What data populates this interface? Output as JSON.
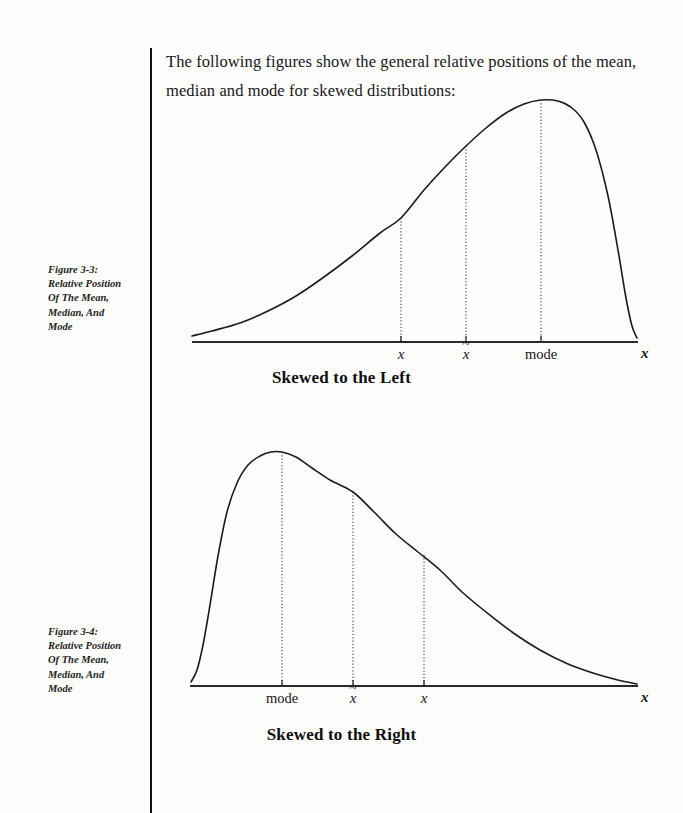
{
  "document": {
    "intro_text": "The following figures show the general relative positions of the mean, median and mode for skewed distributions:"
  },
  "captions": {
    "figure1": {
      "line1": "Figure 3-3:",
      "line2": "Relative Position",
      "line3": "Of The Mean,",
      "line4": "Median, And",
      "line5": "Mode"
    },
    "figure2": {
      "line1": "Figure 3-4:",
      "line2": "Relative Position",
      "line3": "Of The Mean,",
      "line4": "Median, And",
      "line5": "Mode"
    }
  },
  "symbols": {
    "mean_base": "x",
    "mean_mark": "‾",
    "median_base": "x",
    "median_mark": "~",
    "mode_label": "mode",
    "axis_variable": "x"
  },
  "chart_data": [
    {
      "type": "line",
      "title": "Skewed to the Left",
      "xlabel": "x",
      "ylabel": "",
      "grid": false,
      "legend": false,
      "annotations": [
        {
          "name": "mean",
          "label": "x̄",
          "x": 401,
          "curve_y": 218
        },
        {
          "name": "median",
          "label": "x̃",
          "x": 466,
          "curve_y": 146
        },
        {
          "name": "mode",
          "label": "mode",
          "x": 541,
          "curve_y": 100
        }
      ],
      "axis": {
        "x_start": 192,
        "x_end": 638,
        "y": 342
      },
      "peak": {
        "x": 541,
        "y": 100
      },
      "tail_side": "left",
      "curve_points": [
        [
          192,
          336
        ],
        [
          212,
          331
        ],
        [
          240,
          323
        ],
        [
          268,
          311
        ],
        [
          296,
          296
        ],
        [
          324,
          277
        ],
        [
          352,
          256
        ],
        [
          380,
          233
        ],
        [
          401,
          218
        ],
        [
          424,
          190
        ],
        [
          446,
          166
        ],
        [
          466,
          146
        ],
        [
          486,
          128
        ],
        [
          506,
          113
        ],
        [
          524,
          104
        ],
        [
          541,
          100
        ],
        [
          558,
          101
        ],
        [
          572,
          108
        ],
        [
          584,
          122
        ],
        [
          596,
          150
        ],
        [
          608,
          196
        ],
        [
          618,
          250
        ],
        [
          626,
          298
        ],
        [
          632,
          326
        ],
        [
          637,
          338
        ]
      ]
    },
    {
      "type": "line",
      "title": "Skewed to the Right",
      "xlabel": "x",
      "ylabel": "",
      "grid": false,
      "legend": false,
      "annotations": [
        {
          "name": "mode",
          "label": "mode",
          "x": 282,
          "curve_y": 452
        },
        {
          "name": "median",
          "label": "x̃",
          "x": 353,
          "curve_y": 492
        },
        {
          "name": "mean",
          "label": "x̄",
          "x": 424,
          "curve_y": 555
        }
      ],
      "axis": {
        "x_start": 190,
        "x_end": 638,
        "y": 686
      },
      "peak": {
        "x": 282,
        "y": 452
      },
      "tail_side": "right",
      "curve_points": [
        [
          191,
          682
        ],
        [
          197,
          670
        ],
        [
          203,
          645
        ],
        [
          210,
          605
        ],
        [
          218,
          556
        ],
        [
          227,
          512
        ],
        [
          237,
          483
        ],
        [
          248,
          465
        ],
        [
          260,
          456
        ],
        [
          271,
          452
        ],
        [
          282,
          452
        ],
        [
          296,
          457
        ],
        [
          312,
          468
        ],
        [
          330,
          480
        ],
        [
          353,
          492
        ],
        [
          374,
          512
        ],
        [
          396,
          534
        ],
        [
          418,
          552
        ],
        [
          440,
          570
        ],
        [
          462,
          592
        ],
        [
          486,
          612
        ],
        [
          512,
          632
        ],
        [
          540,
          650
        ],
        [
          568,
          664
        ],
        [
          596,
          674
        ],
        [
          618,
          680
        ],
        [
          637,
          684
        ]
      ]
    }
  ]
}
